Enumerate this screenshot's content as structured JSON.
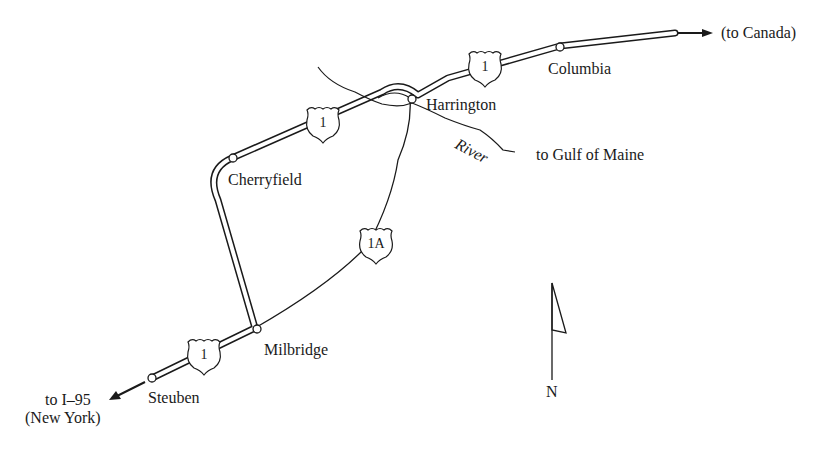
{
  "map": {
    "towns": {
      "columbia": "Columbia",
      "harrington": "Harrington",
      "cherryfield": "Cherryfield",
      "milbridge": "Milbridge",
      "steuben": "Steuben"
    },
    "directions": {
      "to_canada": "(to Canada)",
      "to_gulf": "to Gulf of Maine",
      "to_i95_line1": "to I–95",
      "to_i95_line2": "(New York)"
    },
    "water": {
      "river_label": "River"
    },
    "route_shields": {
      "route1_a": "1",
      "route1_b": "1",
      "route1_c": "1",
      "route1a": "1A"
    },
    "compass": {
      "north_label": "N"
    },
    "colors": {
      "ink": "#1a1a1a",
      "background": "#ffffff"
    }
  }
}
